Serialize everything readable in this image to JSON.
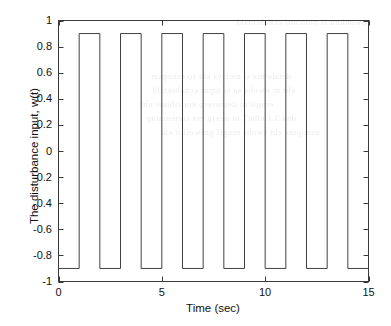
{
  "figure": {
    "background_color": "#ffffff",
    "axis_color": "#3a3a3a",
    "line_color": "#404040",
    "xlabel": "Time (sec)",
    "ylabel": "The disturbance input, w(t)",
    "xticks": [
      "0",
      "5",
      "10",
      "15"
    ],
    "yticks": [
      "1",
      "0.8",
      "0.6",
      "0.4",
      "0.2",
      "0",
      "-0.2",
      "-0.4",
      "-0.6",
      "-0.8",
      "-1"
    ]
  },
  "scan_bleed": {
    "lines": [
      "nwonknu si noitcnuf ecnabrutsid",
      "detalumis si metsys eht fo esnopser",
      "eht ni nwohs sa si tupni ecnabrutsid",
      "erugif ni detneserp era stluser eht",
      "dna 3.1 elbaT ni nevig era sretemarap",
      "esnopser eht swohs erugif gniwollof eht"
    ]
  },
  "chart_data": {
    "type": "line",
    "title": "",
    "xlabel": "Time (sec)",
    "ylabel": "The disturbance input, w(t)",
    "xlim": [
      0,
      15
    ],
    "ylim": [
      -1,
      1
    ],
    "xticks": [
      0,
      5,
      10,
      15
    ],
    "yticks": [
      1,
      0.8,
      0.6,
      0.4,
      0.2,
      0,
      -0.2,
      -0.4,
      -0.6,
      -0.8,
      -1
    ],
    "grid": false,
    "legend": null,
    "waveform": {
      "shape": "square",
      "high_level": 0.9,
      "low_level": -0.9,
      "period": 2,
      "duty_cycle": 0.5,
      "phase_note": "starts low at t=0, rises at t=1",
      "pulse_count": 7
    },
    "series": [
      {
        "name": "w(t)",
        "x": [
          0,
          1,
          1,
          2,
          2,
          3,
          3,
          4,
          4,
          5,
          5,
          6,
          6,
          7,
          7,
          8,
          8,
          9,
          9,
          10,
          10,
          11,
          11,
          12,
          12,
          13,
          13,
          14,
          14,
          15
        ],
        "y": [
          -0.9,
          -0.9,
          0.9,
          0.9,
          -0.9,
          -0.9,
          0.9,
          0.9,
          -0.9,
          -0.9,
          0.9,
          0.9,
          -0.9,
          -0.9,
          0.9,
          0.9,
          -0.9,
          -0.9,
          0.9,
          0.9,
          -0.9,
          -0.9,
          0.9,
          0.9,
          -0.9,
          -0.9,
          0.9,
          0.9,
          -0.9,
          -0.9
        ]
      }
    ]
  }
}
